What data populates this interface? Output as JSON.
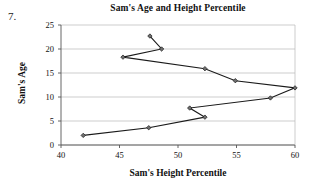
{
  "question_number": "7.",
  "chart_data": {
    "type": "line",
    "title": "Sam's Age and Height Percentile",
    "xlabel": "Sam's Height Percentile",
    "ylabel": "Sam's Age",
    "xlim": [
      40,
      60
    ],
    "ylim": [
      0,
      25
    ],
    "xticks": [
      40,
      45,
      50,
      55,
      60
    ],
    "yticks": [
      0,
      5,
      10,
      15,
      20,
      25
    ],
    "grid": "horizontal",
    "legend": "none",
    "marker": "diamond",
    "line_color": "#1a1a1a",
    "grid_color": "#b8b8b8",
    "axis_color": "#555555",
    "series": [
      {
        "name": "Sam",
        "points": [
          {
            "x": 41.9,
            "y": 2.0
          },
          {
            "x": 47.5,
            "y": 3.6
          },
          {
            "x": 52.3,
            "y": 5.8
          },
          {
            "x": 51.0,
            "y": 7.7
          },
          {
            "x": 57.9,
            "y": 9.8
          },
          {
            "x": 60.0,
            "y": 11.9
          },
          {
            "x": 54.9,
            "y": 13.4
          },
          {
            "x": 52.3,
            "y": 15.9
          },
          {
            "x": 45.3,
            "y": 18.3
          },
          {
            "x": 48.6,
            "y": 20.0
          },
          {
            "x": 47.6,
            "y": 22.7
          }
        ]
      }
    ]
  }
}
